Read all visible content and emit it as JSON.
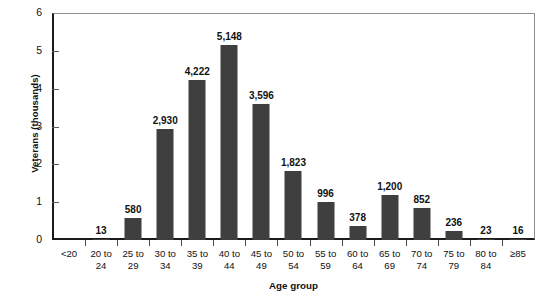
{
  "chart_data": {
    "type": "bar",
    "title": "",
    "xlabel": "Age group",
    "ylabel": "Veterans (thousands)",
    "ylim": [
      0,
      6
    ],
    "yticks": [
      0,
      1,
      2,
      3,
      4,
      5,
      6
    ],
    "ytick_labels": [
      "0",
      "1",
      "2",
      "3",
      "4",
      "5",
      "6"
    ],
    "grid": false,
    "legend": null,
    "bar_color": "#3f3f3f",
    "axis_color": "#1a1a1a",
    "categories": [
      "<20",
      "20 to 24",
      "25 to 29",
      "30 to 34",
      "35 to 39",
      "40 to 44",
      "45 to 49",
      "50 to 54",
      "55 to 59",
      "60 to 64",
      "65 to 69",
      "70 to 74",
      "75 to 79",
      "80 to 84",
      "≥85"
    ],
    "category_lines": [
      {
        "l1": "<20",
        "l2": ""
      },
      {
        "l1": "20 to",
        "l2": "24"
      },
      {
        "l1": "25 to",
        "l2": "29"
      },
      {
        "l1": "30 to",
        "l2": "34"
      },
      {
        "l1": "35 to",
        "l2": "39"
      },
      {
        "l1": "40 to",
        "l2": "44"
      },
      {
        "l1": "45 to",
        "l2": "49"
      },
      {
        "l1": "50 to",
        "l2": "54"
      },
      {
        "l1": "55 to",
        "l2": "59"
      },
      {
        "l1": "60 to",
        "l2": "64"
      },
      {
        "l1": "65 to",
        "l2": "69"
      },
      {
        "l1": "70 to",
        "l2": "74"
      },
      {
        "l1": "75 to",
        "l2": "79"
      },
      {
        "l1": "80 to",
        "l2": "84"
      },
      {
        "l1": "≥85",
        "l2": ""
      }
    ],
    "values": [
      0,
      13,
      580,
      2930,
      4222,
      5148,
      3596,
      1823,
      996,
      378,
      1200,
      852,
      236,
      23,
      16
    ],
    "value_labels": [
      "",
      "13",
      "580",
      "2,930",
      "4,222",
      "5,148",
      "3,596",
      "1,823",
      "996",
      "378",
      "1,200",
      "852",
      "236",
      "23",
      "16"
    ],
    "value_unit": "thousands"
  }
}
